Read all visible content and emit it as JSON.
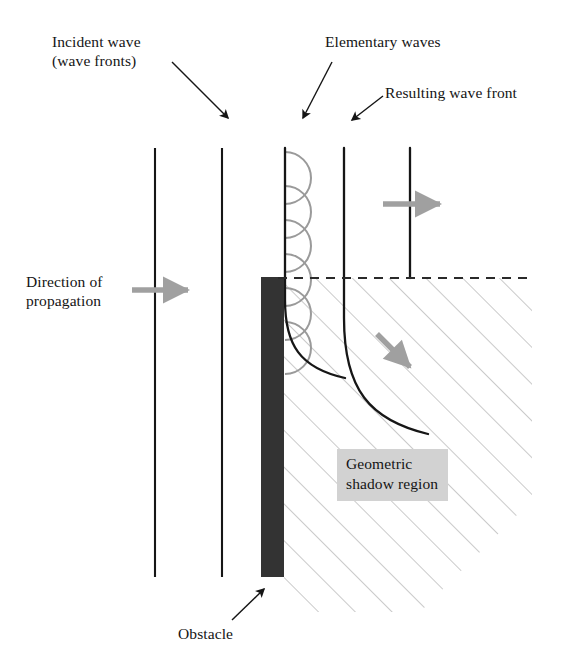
{
  "figure": {
    "kind": "physics-diagram",
    "topic": "diffraction-of-waves-at-an-obstacle",
    "background_color": "#ffffff"
  },
  "labels": {
    "incident_wave": "Incident wave\n(wave fronts)",
    "elementary_waves": "Elementary waves",
    "resulting_wave_front": "Resulting wave front",
    "direction_of_propagation": "Direction of\npropagation",
    "geometric_shadow_region": "Geometric\nshadow region",
    "obstacle": "Obstacle"
  },
  "colors": {
    "ink": "#141414",
    "obstacle_fill": "#333333",
    "elementary_wave_stroke": "#9a9a9a",
    "hatch_stroke": "#9d9d9d",
    "gray_arrow_fill": "#a0a0a0",
    "shadow_label_bg": "#d2d2d2",
    "dashed_line": "#2a2a2a"
  },
  "geometry": {
    "wave_front_lines_x": [
      155,
      222,
      285,
      344,
      410
    ],
    "wave_front_top_y": 148,
    "wave_front_bottom_y": 577,
    "obstacle": {
      "x": 261,
      "y": 277,
      "width": 23,
      "height": 300
    },
    "dashed_line_y": 278,
    "dashed_line_x_range": [
      278,
      532
    ],
    "elementary_wave_count": 6,
    "elementary_wave_radius": 26,
    "elementary_wave_center_x": 285,
    "elementary_wave_first_center_y": 178,
    "elementary_wave_spacing": 34,
    "shadow_hatch_angle_deg": 45,
    "shadow_hatch_spacing": 26
  },
  "callouts": [
    {
      "name": "incident-wave",
      "from": [
        172,
        62
      ],
      "to": [
        232,
        122
      ]
    },
    {
      "name": "elementary-waves",
      "from": [
        330,
        62
      ],
      "to": [
        300,
        122
      ]
    },
    {
      "name": "resulting-wave-front",
      "from": [
        382,
        95
      ],
      "to": [
        349,
        122
      ]
    },
    {
      "name": "obstacle",
      "from": [
        230,
        622
      ],
      "to": [
        265,
        586
      ]
    }
  ],
  "gray_arrows": [
    {
      "name": "direction-of-propagation-arrow",
      "x1": 132,
      "y1": 290,
      "x2": 200,
      "y2": 290
    },
    {
      "name": "upper-right-propagation-arrow",
      "x1": 383,
      "y1": 204,
      "x2": 452,
      "y2": 204
    },
    {
      "name": "diffracted-propagation-arrow",
      "x1": 377,
      "y1": 334,
      "x2": 423,
      "y2": 380
    }
  ]
}
